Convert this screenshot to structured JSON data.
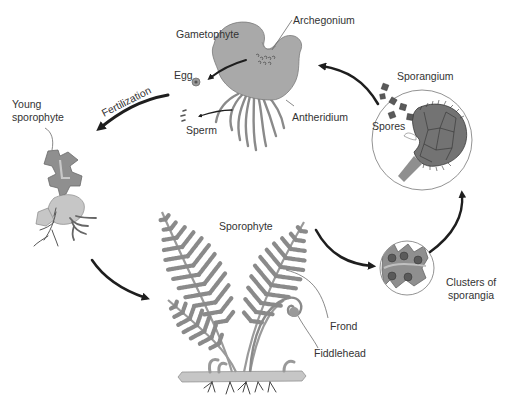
{
  "colors": {
    "tissue": "#a8a8a8",
    "tissue_dark": "#8a8a8a",
    "outline": "#6e6e6e",
    "arrow": "#1e1e1e",
    "label": "#333333",
    "leader": "#6b6b6b"
  },
  "labels": {
    "gametophyte": "Gametophyte",
    "archegonium": "Archegonium",
    "egg": "Egg",
    "sperm": "Sperm",
    "antheridium": "Antheridium",
    "sporangium": "Sporangium",
    "spores": "Spores",
    "fertilization": "Fertilization",
    "young_sporophyte_line1": "Young",
    "young_sporophyte_line2": "sporophyte",
    "sporophyte": "Sporophyte",
    "frond": "Frond",
    "fiddlehead": "Fiddlehead",
    "clusters_line1": "Clusters of",
    "clusters_line2": "sporangia"
  },
  "cycle_stages": [
    "Gametophyte",
    "Fertilization",
    "Young sporophyte",
    "Sporophyte",
    "Clusters of sporangia",
    "Sporangium"
  ]
}
